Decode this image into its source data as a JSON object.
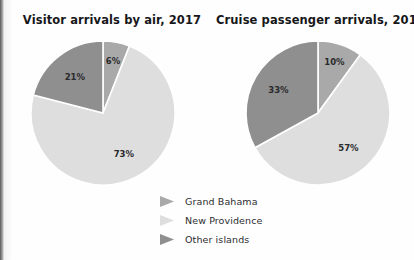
{
  "page": {
    "background_color": "#fefefe"
  },
  "colors": {
    "grand_bahama": "#a9a9a9",
    "new_providence": "#dedede",
    "other_islands": "#8f8f8f",
    "slice_divider": "#ffffff",
    "label_text": "#2a2a2c",
    "title_text": "#17171a"
  },
  "charts": [
    {
      "id": "visitor-arrivals-by-air",
      "title": "Visitor arrivals by air, 2017"
    },
    {
      "id": "cruise-passenger-arrivals",
      "title": "Cruise passenger arrivals, 2017"
    }
  ],
  "legend": {
    "position": "bottom-center",
    "items": [
      {
        "label": "Grand Bahama",
        "marker": "triangle-right-icon",
        "color": "#a9a9a9"
      },
      {
        "label": "New Providence",
        "marker": "triangle-right-icon",
        "color": "#dedede"
      },
      {
        "label": "Other islands",
        "marker": "triangle-right-icon",
        "color": "#8f8f8f"
      }
    ]
  },
  "chart_data": [
    {
      "type": "pie",
      "title": "Visitor arrivals by air, 2017",
      "xlabel": "",
      "ylabel": "",
      "categories": [
        "Grand Bahama",
        "New Providence",
        "Other islands"
      ],
      "values": [
        6,
        73,
        21
      ],
      "labels": [
        "6%",
        "73%",
        "21%"
      ],
      "colors": [
        "#a9a9a9",
        "#dedede",
        "#8f8f8f"
      ],
      "units": "percent",
      "start_angle_deg": 0,
      "direction": "clockwise",
      "legend": "bottom-center"
    },
    {
      "type": "pie",
      "title": "Cruise passenger arrivals, 2017",
      "xlabel": "",
      "ylabel": "",
      "categories": [
        "Grand Bahama",
        "New Providence",
        "Other islands"
      ],
      "values": [
        10,
        57,
        33
      ],
      "labels": [
        "10%",
        "57%",
        "33%"
      ],
      "colors": [
        "#a9a9a9",
        "#dedede",
        "#8f8f8f"
      ],
      "units": "percent",
      "start_angle_deg": 0,
      "direction": "clockwise",
      "legend": "bottom-center"
    }
  ]
}
